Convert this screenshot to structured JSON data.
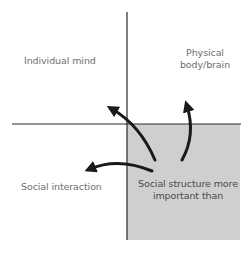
{
  "diagram": {
    "quadrants": {
      "top_left": {
        "label": "Individual mind"
      },
      "top_right": {
        "label_line1": "Physical",
        "label_line2": "body/brain"
      },
      "bottom_left": {
        "label": "Social interaction"
      },
      "bottom_right": {
        "label_line1": "Social structure more",
        "label_line2": "important than",
        "highlighted": true
      }
    },
    "arrows": [
      {
        "from": "bottom_right",
        "to": "top_left"
      },
      {
        "from": "bottom_right",
        "to": "top_right"
      },
      {
        "from": "bottom_right",
        "to": "bottom_left"
      }
    ],
    "colors": {
      "axis": "#2b2b2b",
      "highlight_fill": "#cfcfcf",
      "arrow": "#1a1a1a",
      "label_text": "#6e6e6e"
    }
  }
}
